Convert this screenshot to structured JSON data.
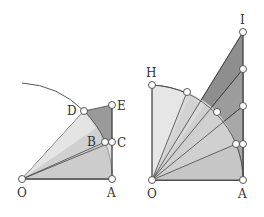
{
  "colors": {
    "background": "#ffffff",
    "fill_light": "#e6e6e6",
    "fill_mid": "#cfcfcf",
    "fill_dark": "#9a9a9a",
    "fill_darker": "#8a8a8a",
    "stroke": "#444444",
    "point_fill": "#ffffff"
  },
  "left_figure": {
    "labels": {
      "O": "O",
      "A": "A",
      "B": "B",
      "C": "C",
      "D": "D",
      "E": "E"
    }
  },
  "right_figure": {
    "labels": {
      "O": "O",
      "A": "A",
      "H": "H",
      "I": "I"
    }
  }
}
